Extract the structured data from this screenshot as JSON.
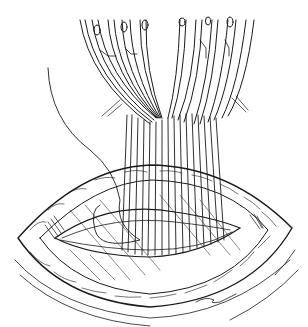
{
  "illustration": {
    "subject": "surgical wound closure with clamped sutures",
    "background": "#ffffff",
    "ink": "#1a1a1a",
    "clamp_bundles": 2,
    "suture_count": 16
  }
}
